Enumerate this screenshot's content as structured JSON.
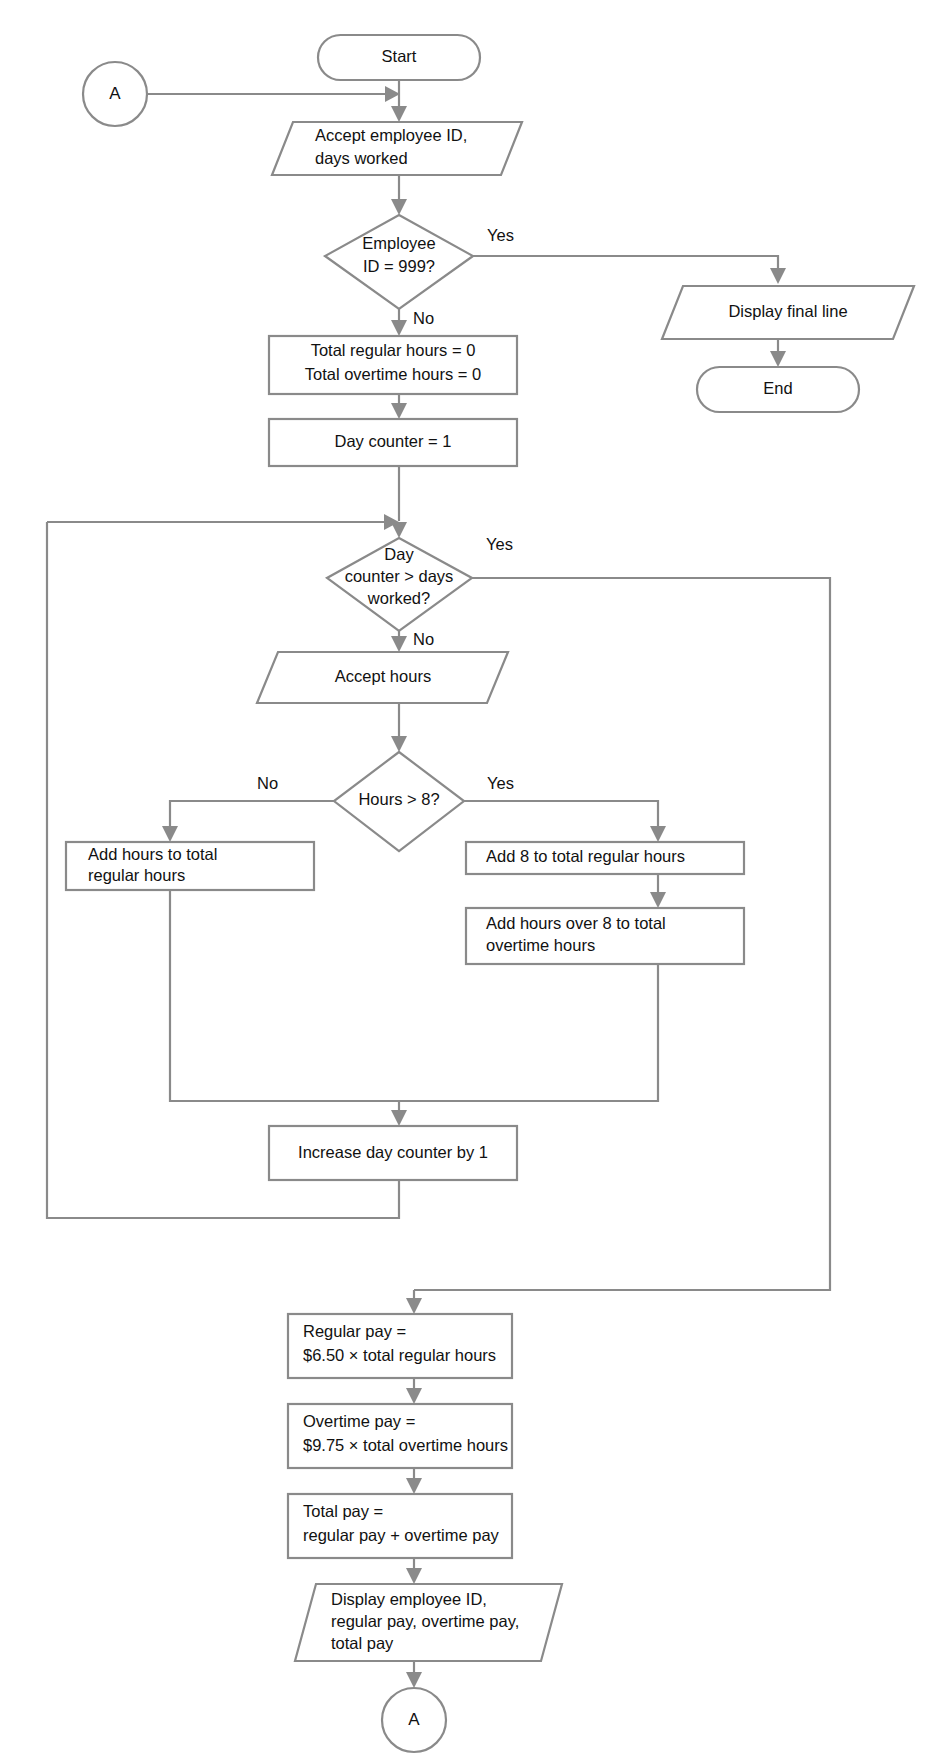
{
  "diagram": {
    "type": "flowchart",
    "line_color": "#8a8a8a",
    "text_color": "#111111",
    "background_color": "#ffffff"
  },
  "nodes": {
    "connector_a_top": {
      "label": "A",
      "shape": "connector-circle"
    },
    "start": {
      "label": "Start",
      "shape": "terminator"
    },
    "accept_input": {
      "line1": "Accept employee ID,",
      "line2": "days worked",
      "shape": "input-output"
    },
    "decision_employee_id": {
      "line1": "Employee",
      "line2": "ID = 999?",
      "shape": "decision"
    },
    "display_final_line": {
      "label": "Display final line",
      "shape": "input-output"
    },
    "end": {
      "label": "End",
      "shape": "terminator"
    },
    "init_totals": {
      "line1": "Total regular hours = 0",
      "line2": "Total overtime hours = 0",
      "shape": "process"
    },
    "init_day_counter": {
      "label": "Day counter  =  1",
      "shape": "process"
    },
    "decision_day_counter": {
      "line1": "Day",
      "line2": "counter > days",
      "line3": "worked?",
      "shape": "decision"
    },
    "accept_hours": {
      "label": "Accept hours",
      "shape": "input-output"
    },
    "decision_hours": {
      "label": "Hours > 8?",
      "shape": "decision"
    },
    "add_hours_regular": {
      "line1": "Add hours to total",
      "line2": "regular hours",
      "shape": "process"
    },
    "add_8_regular": {
      "label": "Add 8 to total regular hours",
      "shape": "process"
    },
    "add_overtime": {
      "line1": "Add hours over 8 to total",
      "line2": "overtime hours",
      "shape": "process"
    },
    "increase_day_counter": {
      "label": "Increase day counter by 1",
      "shape": "process"
    },
    "regular_pay": {
      "line1": "Regular pay  =",
      "line2": "$6.50  ×  total regular hours",
      "shape": "process"
    },
    "overtime_pay": {
      "line1": "Overtime pay  =",
      "line2": "$9.75  ×  total overtime hours",
      "shape": "process"
    },
    "total_pay": {
      "line1": "Total pay  =",
      "line2": "regular pay  +  overtime pay",
      "shape": "process"
    },
    "display_results": {
      "line1": "Display employee ID,",
      "line2": "regular pay, overtime pay,",
      "line3": "total pay",
      "shape": "input-output"
    },
    "connector_a_bottom": {
      "label": "A",
      "shape": "connector-circle"
    }
  },
  "branch_labels": {
    "employee_id_yes": "Yes",
    "employee_id_no": "No",
    "day_counter_yes": "Yes",
    "day_counter_no": "No",
    "hours_no": "No",
    "hours_yes": "Yes"
  },
  "constants": {
    "sentinel_employee_id": "999",
    "regular_hours_threshold": "8",
    "regular_rate": "$6.50",
    "overtime_rate": "$9.75",
    "initial_day_counter": "1",
    "day_counter_increment": "1"
  }
}
